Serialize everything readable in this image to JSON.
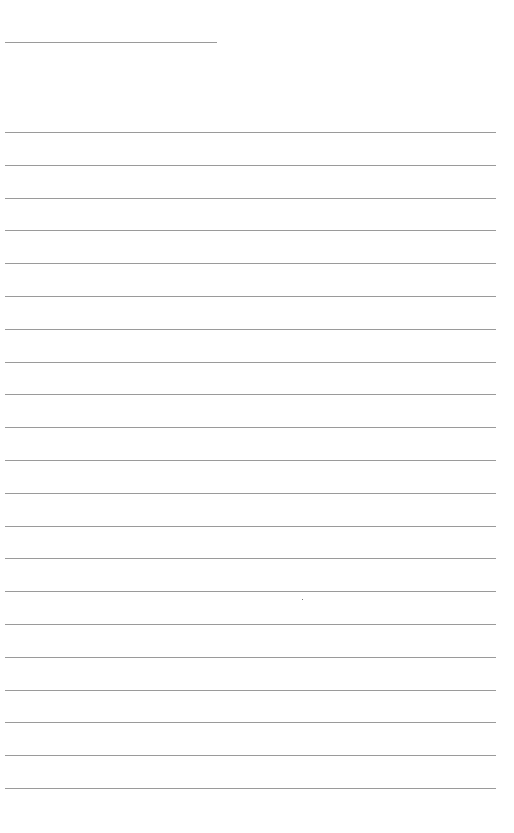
{
  "page": {
    "type": "blank lined paper",
    "background": "#ffffff",
    "line_color": "#9a9a9a",
    "header_line": {
      "x": 5,
      "y": 42,
      "width": 212
    },
    "ruled_lines": {
      "x": 5,
      "width": 491,
      "first_y": 132,
      "spacing": 32.8,
      "count": 21
    },
    "stray_mark": {
      "x": 302,
      "y": 599
    }
  }
}
